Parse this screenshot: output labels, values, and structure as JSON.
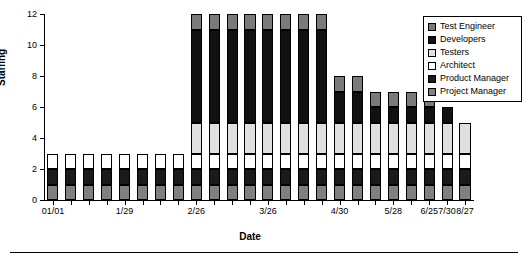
{
  "chart_data": {
    "type": "bar",
    "subtype": "stacked-column",
    "title": "",
    "xlabel": "Date",
    "ylabel": "Staffing",
    "ylim": [
      0,
      12
    ],
    "yticks": [
      0,
      2,
      4,
      6,
      8,
      10,
      12
    ],
    "grid": false,
    "legend_position": "top-right",
    "categories": [
      "01/01",
      "01/08",
      "01/15",
      "01/22",
      "1/29",
      "02/05",
      "02/12",
      "02/19",
      "2/26",
      "03/05",
      "03/12",
      "03/19",
      "3/26",
      "04/02",
      "04/09",
      "04/16",
      "4/30",
      "05/07",
      "05/14",
      "5/28",
      "06/04",
      "6/25",
      "7/30",
      "8/27"
    ],
    "tick_labels": [
      "01/01",
      "1/29",
      "2/26",
      "3/26",
      "4/30",
      "5/28",
      "6/25",
      "7/30",
      "8/27"
    ],
    "tick_label_indices": [
      0,
      4,
      8,
      12,
      16,
      19,
      21,
      22,
      23
    ],
    "series": [
      {
        "name": "Project Manager",
        "color": "#808080",
        "values": [
          1,
          1,
          1,
          1,
          1,
          1,
          1,
          1,
          1,
          1,
          1,
          1,
          1,
          1,
          1,
          1,
          1,
          1,
          1,
          1,
          1,
          1,
          1,
          1
        ]
      },
      {
        "name": "Product Manager",
        "color": "#1a1a1a",
        "values": [
          1,
          1,
          1,
          1,
          1,
          1,
          1,
          1,
          1,
          1,
          1,
          1,
          1,
          1,
          1,
          1,
          1,
          1,
          1,
          1,
          1,
          1,
          1,
          1
        ]
      },
      {
        "name": "Architect",
        "color": "#ffffff",
        "values": [
          1,
          1,
          1,
          1,
          1,
          1,
          1,
          1,
          1,
          1,
          1,
          1,
          1,
          1,
          1,
          1,
          1,
          1,
          1,
          1,
          1,
          1,
          1,
          1
        ]
      },
      {
        "name": "Testers",
        "color": "#e0e0e0",
        "values": [
          0,
          0,
          0,
          0,
          0,
          0,
          0,
          0,
          2,
          2,
          2,
          2,
          2,
          2,
          2,
          2,
          2,
          2,
          2,
          2,
          2,
          2,
          2,
          2
        ]
      },
      {
        "name": "Developers",
        "color": "#111111",
        "values": [
          0,
          0,
          0,
          0,
          0,
          0,
          0,
          0,
          6,
          6,
          6,
          6,
          6,
          6,
          6,
          6,
          2,
          2,
          1,
          1,
          1,
          1,
          1,
          0
        ]
      },
      {
        "name": "Test Engineer",
        "color": "#7a7a7a",
        "values": [
          0,
          0,
          0,
          0,
          0,
          0,
          0,
          0,
          1,
          1,
          1,
          1,
          1,
          1,
          1,
          1,
          1,
          1,
          1,
          1,
          1,
          1,
          0,
          0
        ]
      }
    ],
    "totals": [
      3,
      3,
      3,
      3,
      3,
      3,
      3,
      3,
      11,
      11,
      11,
      11,
      11,
      11,
      11,
      11,
      7,
      7,
      6,
      6,
      6,
      6,
      5,
      5
    ]
  },
  "legend": {
    "items": [
      {
        "label": "Test Engineer",
        "color": "#7a7a7a"
      },
      {
        "label": "Developers",
        "color": "#111111"
      },
      {
        "label": "Testers",
        "color": "#e0e0e0"
      },
      {
        "label": "Architect",
        "color": "#ffffff"
      },
      {
        "label": "Product Manager",
        "color": "#1a1a1a"
      },
      {
        "label": "Project Manager",
        "color": "#808080"
      }
    ]
  },
  "axes": {
    "y_title": "Staffing",
    "x_title": "Date"
  }
}
